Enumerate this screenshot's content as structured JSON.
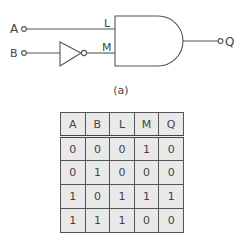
{
  "diagram": {
    "type": "logic-circuit",
    "inputs": [
      {
        "label": "A",
        "connects_to": "L"
      },
      {
        "label": "B",
        "connects_to": "NOT",
        "via": "inverter",
        "output": "M"
      }
    ],
    "gate": {
      "type": "AND",
      "inputs": [
        "L",
        "M"
      ],
      "output": "Q"
    },
    "labels": {
      "A": "A",
      "B": "B",
      "L": "L",
      "M": "M",
      "Q": "Q"
    },
    "caption": "(a)"
  },
  "truth_table": {
    "headers": [
      "A",
      "B",
      "L",
      "M",
      "Q"
    ],
    "rows": [
      [
        "0",
        "0",
        "0",
        "1",
        "0"
      ],
      [
        "0",
        "1",
        "0",
        "0",
        "0"
      ],
      [
        "1",
        "0",
        "1",
        "1",
        "1"
      ],
      [
        "1",
        "1",
        "1",
        "0",
        "0"
      ]
    ]
  },
  "colors": {
    "line": "#555555",
    "cell_fill": "#e9e9e9"
  }
}
